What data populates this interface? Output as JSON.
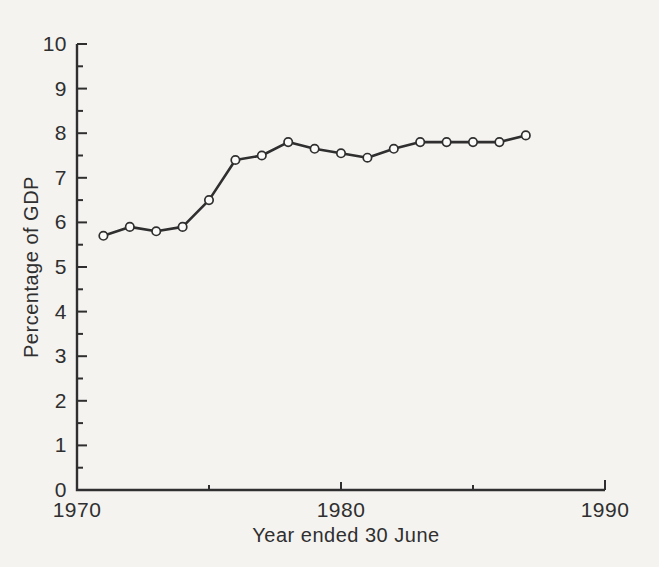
{
  "page": {
    "background": "#f4f3f0"
  },
  "chart_data": {
    "type": "line",
    "title": "",
    "xlabel": "Year ended 30 June",
    "ylabel": "Percentage of GDP",
    "x": [
      1971,
      1972,
      1973,
      1974,
      1975,
      1976,
      1977,
      1978,
      1979,
      1980,
      1981,
      1982,
      1983,
      1984,
      1985,
      1986,
      1987
    ],
    "series": [
      {
        "name": "Percentage of GDP",
        "values": [
          5.7,
          5.9,
          5.8,
          5.9,
          6.5,
          7.4,
          7.5,
          7.8,
          7.65,
          7.55,
          7.45,
          7.65,
          7.8,
          7.8,
          7.8,
          7.8,
          7.95
        ]
      }
    ],
    "xlim": [
      1970,
      1990
    ],
    "ylim": [
      0,
      10
    ],
    "x_axis": {
      "labels": [
        1970,
        1980,
        1990
      ],
      "ticks": [
        1975,
        1980,
        1985,
        1990
      ]
    },
    "y_axis": {
      "major_step": 1,
      "minor_step": 0.5,
      "labels": [
        0,
        1,
        2,
        3,
        4,
        5,
        6,
        7,
        8,
        9,
        10
      ]
    },
    "marker": "open-circle",
    "grid": false,
    "legend": false,
    "colors": {
      "axis": "#2f2f2f",
      "line": "#2f2f2f",
      "marker_fill": "#fbfbf9",
      "text": "#2f2f2f"
    }
  }
}
